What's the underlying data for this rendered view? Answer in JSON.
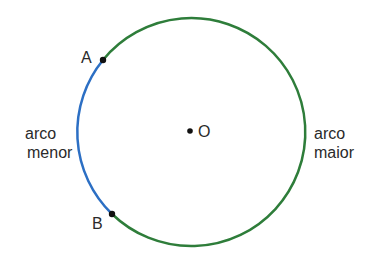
{
  "diagram": {
    "title": "",
    "circle": {
      "cx": 190,
      "cy": 131,
      "r": 114
    },
    "colors": {
      "major_arc": "#2e7d3a",
      "minor_arc": "#2c6fc4",
      "point": "#111111",
      "text": "#2a2a2a"
    },
    "points": {
      "A": {
        "label": "A",
        "x": 103,
        "y": 60
      },
      "B": {
        "label": "B",
        "x": 112,
        "y": 214
      },
      "O": {
        "label": "O",
        "x": 190,
        "y": 131
      }
    },
    "labels": {
      "minor_arc_line1": "arco",
      "minor_arc_line2": "menor",
      "major_arc_line1": "arco",
      "major_arc_line2": "maior"
    }
  }
}
